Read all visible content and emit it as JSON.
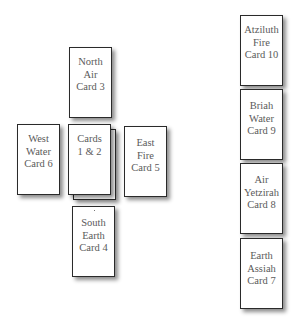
{
  "diagram": {
    "cross_spread": {
      "cards": [
        {
          "id": "north",
          "lines": [
            "North",
            "Air",
            "Card 3"
          ]
        },
        {
          "id": "west",
          "lines": [
            "West",
            "Water",
            "Card 6"
          ]
        },
        {
          "id": "center",
          "lines": [
            "Cards",
            "1 & 2"
          ]
        },
        {
          "id": "east",
          "lines": [
            "East",
            "Fire",
            "Card 5"
          ]
        },
        {
          "id": "south",
          "lines": [
            "South",
            "Earth",
            "Card 4"
          ]
        }
      ]
    },
    "column_spread": {
      "cards": [
        {
          "id": "atziluth",
          "lines": [
            "Atziluth",
            "Fire",
            "Card 10"
          ]
        },
        {
          "id": "briah",
          "lines": [
            "Briah",
            "Water",
            "Card 9"
          ]
        },
        {
          "id": "yetzirah",
          "lines": [
            "Air",
            "Yetzirah",
            "Card 8"
          ]
        },
        {
          "id": "assiah",
          "lines": [
            "Earth",
            "Assiah",
            "Card 7"
          ]
        }
      ]
    }
  }
}
